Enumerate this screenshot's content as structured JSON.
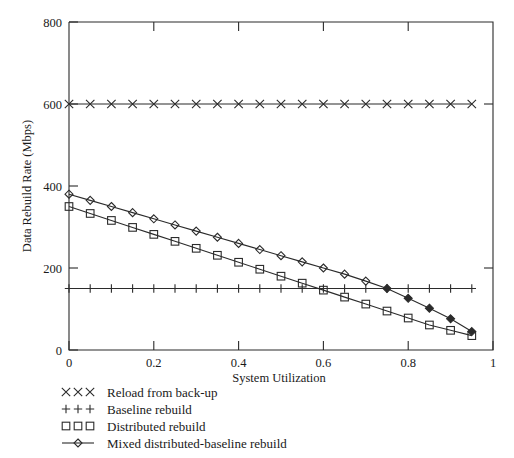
{
  "chart_data": {
    "type": "line",
    "title": "",
    "xlabel": "System Utilization",
    "ylabel": "Data Rebuild Rate (Mbps)",
    "xlim": [
      0,
      1
    ],
    "ylim": [
      0,
      800
    ],
    "xticks": [
      "0",
      "0.2",
      "0.4",
      "0.6",
      "0.8",
      "1"
    ],
    "xtick_values": [
      0,
      0.2,
      0.4,
      0.6,
      0.8,
      1
    ],
    "yticks": [
      "0",
      "200",
      "400",
      "600",
      "800"
    ],
    "ytick_values": [
      0,
      200,
      400,
      600,
      800
    ],
    "grid": false,
    "legend_position": "below-left",
    "x": [
      0,
      0.05,
      0.1,
      0.15,
      0.2,
      0.25,
      0.3,
      0.35,
      0.4,
      0.45,
      0.5,
      0.55,
      0.6,
      0.65,
      0.7,
      0.75,
      0.8,
      0.85,
      0.9,
      0.95
    ],
    "series": [
      {
        "name": "Reload from back-up",
        "marker": "x",
        "values": [
          600,
          600,
          600,
          600,
          600,
          600,
          600,
          600,
          600,
          600,
          600,
          600,
          600,
          600,
          600,
          600,
          600,
          600,
          600,
          600
        ]
      },
      {
        "name": "Baseline rebuild",
        "marker": "plus",
        "values": [
          150,
          150,
          150,
          150,
          150,
          150,
          150,
          150,
          150,
          150,
          150,
          150,
          150,
          150,
          150,
          150,
          150,
          150,
          150,
          150
        ]
      },
      {
        "name": "Distributed rebuild",
        "marker": "square",
        "values": [
          350,
          333,
          316,
          299,
          282,
          265,
          248,
          231,
          214,
          197,
          180,
          163,
          146,
          129,
          112,
          95,
          78,
          61,
          48,
          35
        ]
      },
      {
        "name": "Mixed distributed-baseline rebuild",
        "marker": "diamond",
        "values": [
          380,
          365,
          350,
          335,
          320,
          305,
          290,
          275,
          260,
          245,
          230,
          215,
          200,
          185,
          168,
          150,
          126,
          102,
          76,
          45
        ]
      }
    ]
  },
  "legend": {
    "items": [
      {
        "label": "Reload from back-up",
        "marker": "x"
      },
      {
        "label": "Baseline rebuild",
        "marker": "plus"
      },
      {
        "label": "Distributed rebuild",
        "marker": "square"
      },
      {
        "label": "Mixed distributed-baseline rebuild",
        "marker": "diamond"
      }
    ]
  },
  "axis": {
    "y_title": "Data Rebuild Rate (Mbps)",
    "x_title": "System Utilization",
    "ytick_0": "0",
    "ytick_200": "200",
    "ytick_400": "400",
    "ytick_600": "600",
    "ytick_800": "800",
    "xtick_0": "0",
    "xtick_02": "0.2",
    "xtick_04": "0.4",
    "xtick_06": "0.6",
    "xtick_08": "0.8",
    "xtick_1": "1"
  }
}
